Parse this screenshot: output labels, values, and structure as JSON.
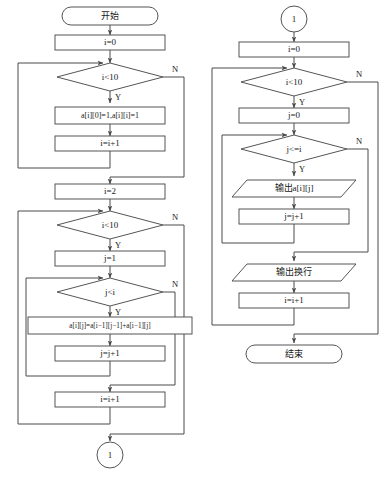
{
  "diagram": {
    "type": "flowchart",
    "colors": {
      "background": "#ffffff",
      "shape_fill": "#ffffff",
      "shape_stroke": "#555555",
      "connector_stroke": "#4a4a4a",
      "text": "#1a1a1a"
    },
    "edge_labels": {
      "yes": "Y",
      "no": "N"
    }
  },
  "left_column": {
    "nodes": [
      {
        "id": "start",
        "shape": "terminator",
        "text": "开始"
      },
      {
        "id": "init_i_0",
        "shape": "process",
        "text": "i=0"
      },
      {
        "id": "cond_i_lt10_a",
        "shape": "decision",
        "text": "i<10"
      },
      {
        "id": "set_edges",
        "shape": "process",
        "text": "a[i][0]=1,a[i][i]=1"
      },
      {
        "id": "inc_i_a",
        "shape": "process",
        "text": "i=i+1"
      },
      {
        "id": "init_i_2",
        "shape": "process",
        "text": "i=2"
      },
      {
        "id": "cond_i_lt10_b",
        "shape": "decision",
        "text": "i<10"
      },
      {
        "id": "init_j_1",
        "shape": "process",
        "text": "j=1"
      },
      {
        "id": "cond_j_lt_i",
        "shape": "decision",
        "text": "j<i"
      },
      {
        "id": "pascal_sum",
        "shape": "process",
        "text": "a[i][j]=a[i−1][j−1]+a[i−1][j]"
      },
      {
        "id": "inc_j_a",
        "shape": "process",
        "text": "j=j+1"
      },
      {
        "id": "inc_i_b",
        "shape": "process",
        "text": "i=i+1"
      },
      {
        "id": "connector_out",
        "shape": "connector",
        "text": "1"
      }
    ]
  },
  "right_column": {
    "nodes": [
      {
        "id": "connector_in",
        "shape": "connector",
        "text": "1"
      },
      {
        "id": "init_i_0_r",
        "shape": "process",
        "text": "i=0"
      },
      {
        "id": "cond_i_lt10_c",
        "shape": "decision",
        "text": "i<10"
      },
      {
        "id": "init_j_0",
        "shape": "process",
        "text": "j=0"
      },
      {
        "id": "cond_j_le_i",
        "shape": "decision",
        "text": "j<=i"
      },
      {
        "id": "print_cell",
        "shape": "io",
        "text": "输出a[i][j]"
      },
      {
        "id": "inc_j_b",
        "shape": "process",
        "text": "j=j+1"
      },
      {
        "id": "print_newline",
        "shape": "io",
        "text": "输出换行"
      },
      {
        "id": "inc_i_c",
        "shape": "process",
        "text": "i=i+1"
      },
      {
        "id": "end",
        "shape": "terminator",
        "text": "结束"
      }
    ]
  }
}
